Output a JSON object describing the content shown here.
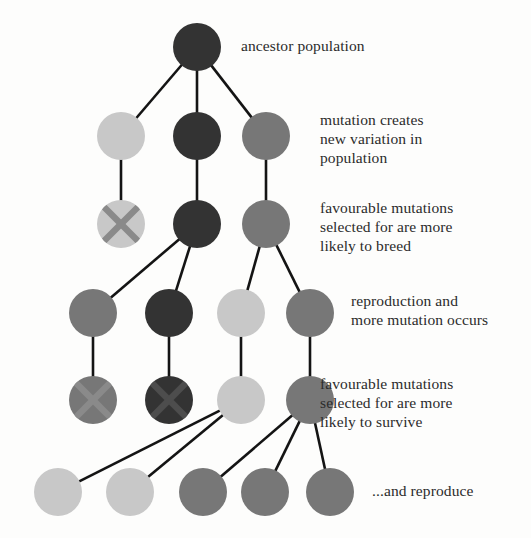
{
  "diagram": {
    "type": "node-link-tree",
    "background_color": "#fdfdfc",
    "edge_color": "#141414",
    "edge_width": 2.6,
    "node_radius": 24,
    "cross_mark": "x-mark-icon",
    "palette": {
      "dark": "#333333",
      "medium": "#777777",
      "light": "#c8c8c8",
      "cross_dark": "#4d4d4d",
      "cross_light": "#8a8a8a",
      "text": "#2b2b2b"
    },
    "generations": [
      {
        "id": "gen-1",
        "name": "ancestor",
        "nodes": [
          {
            "id": "n1",
            "cx": 197,
            "cy": 47,
            "shade": "dark",
            "crossed": false
          }
        ]
      },
      {
        "id": "gen-2",
        "name": "mutation",
        "nodes": [
          {
            "id": "n2",
            "cx": 121,
            "cy": 136,
            "shade": "light",
            "crossed": false
          },
          {
            "id": "n3",
            "cx": 197,
            "cy": 136,
            "shade": "dark",
            "crossed": false
          },
          {
            "id": "n4",
            "cx": 266,
            "cy": 136,
            "shade": "medium",
            "crossed": false
          }
        ]
      },
      {
        "id": "gen-3",
        "name": "selection-breed",
        "nodes": [
          {
            "id": "n5",
            "cx": 121,
            "cy": 224,
            "shade": "light",
            "crossed": true
          },
          {
            "id": "n6",
            "cx": 197,
            "cy": 224,
            "shade": "dark",
            "crossed": false
          },
          {
            "id": "n7",
            "cx": 266,
            "cy": 224,
            "shade": "medium",
            "crossed": false
          }
        ]
      },
      {
        "id": "gen-4",
        "name": "reproduction",
        "nodes": [
          {
            "id": "n8",
            "cx": 93,
            "cy": 313,
            "shade": "medium",
            "crossed": false
          },
          {
            "id": "n9",
            "cx": 169,
            "cy": 313,
            "shade": "dark",
            "crossed": false
          },
          {
            "id": "n10",
            "cx": 241,
            "cy": 313,
            "shade": "light",
            "crossed": false
          },
          {
            "id": "n11",
            "cx": 310,
            "cy": 313,
            "shade": "medium",
            "crossed": false
          }
        ]
      },
      {
        "id": "gen-5",
        "name": "selection-survive",
        "nodes": [
          {
            "id": "n12",
            "cx": 93,
            "cy": 400,
            "shade": "medium",
            "crossed": true
          },
          {
            "id": "n13",
            "cx": 169,
            "cy": 400,
            "shade": "dark",
            "crossed": true
          },
          {
            "id": "n14",
            "cx": 241,
            "cy": 400,
            "shade": "light",
            "crossed": false
          },
          {
            "id": "n15",
            "cx": 310,
            "cy": 400,
            "shade": "medium",
            "crossed": false
          }
        ]
      },
      {
        "id": "gen-6",
        "name": "reproduce",
        "nodes": [
          {
            "id": "n16",
            "cx": 58,
            "cy": 492,
            "shade": "light",
            "crossed": false
          },
          {
            "id": "n17",
            "cx": 130,
            "cy": 492,
            "shade": "light",
            "crossed": false
          },
          {
            "id": "n18",
            "cx": 203,
            "cy": 492,
            "shade": "medium",
            "crossed": false
          },
          {
            "id": "n19",
            "cx": 265,
            "cy": 492,
            "shade": "medium",
            "crossed": false
          },
          {
            "id": "n20",
            "cx": 330,
            "cy": 492,
            "shade": "medium",
            "crossed": false
          }
        ]
      }
    ],
    "edges": [
      {
        "from": "n1",
        "to": "n2"
      },
      {
        "from": "n1",
        "to": "n3"
      },
      {
        "from": "n1",
        "to": "n4"
      },
      {
        "from": "n2",
        "to": "n5"
      },
      {
        "from": "n3",
        "to": "n6"
      },
      {
        "from": "n4",
        "to": "n7"
      },
      {
        "from": "n6",
        "to": "n8"
      },
      {
        "from": "n6",
        "to": "n9"
      },
      {
        "from": "n7",
        "to": "n10"
      },
      {
        "from": "n7",
        "to": "n11"
      },
      {
        "from": "n8",
        "to": "n12"
      },
      {
        "from": "n9",
        "to": "n13"
      },
      {
        "from": "n10",
        "to": "n14"
      },
      {
        "from": "n11",
        "to": "n15"
      },
      {
        "from": "n14",
        "to": "n16"
      },
      {
        "from": "n14",
        "to": "n17"
      },
      {
        "from": "n15",
        "to": "n18"
      },
      {
        "from": "n15",
        "to": "n19"
      },
      {
        "from": "n15",
        "to": "n20"
      }
    ],
    "labels": [
      {
        "id": "label-ancestor",
        "name": "label-ancestor-population",
        "text": "ancestor population",
        "x": 241,
        "y": 36
      },
      {
        "id": "label-mutation",
        "name": "label-mutation-creates-variation",
        "text": "mutation creates\nnew variation in\npopulation",
        "x": 320,
        "y": 110
      },
      {
        "id": "label-breed",
        "name": "label-favourable-mutations-breed",
        "text": "favourable mutations\nselected for are more\nlikely to breed",
        "x": 320,
        "y": 198
      },
      {
        "id": "label-reproduction",
        "name": "label-reproduction-more-mutation",
        "text": "reproduction and\nmore mutation occurs",
        "x": 351,
        "y": 291
      },
      {
        "id": "label-survive",
        "name": "label-favourable-mutations-survive",
        "text": "favourable mutations\nselected for are more\nlikely to survive",
        "x": 320,
        "y": 374
      },
      {
        "id": "label-reproduce",
        "name": "label-and-reproduce",
        "text": "...and reproduce",
        "x": 372,
        "y": 481
      }
    ]
  }
}
